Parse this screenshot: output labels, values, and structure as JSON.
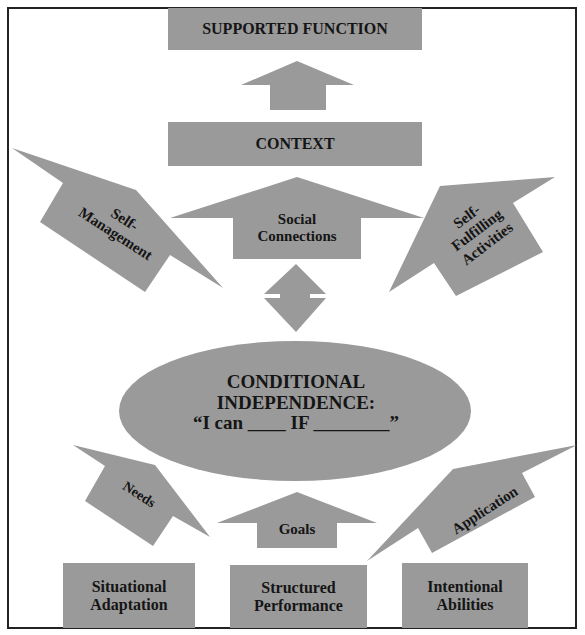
{
  "diagram": {
    "colors": {
      "shape_fill": "#9a9a9a",
      "text": "#151515",
      "border": "#222222",
      "background": "#ffffff"
    },
    "boxes": {
      "supported_function": "SUPPORTED FUNCTION",
      "context": "CONTEXT",
      "situational_adaptation": {
        "line1": "Situational",
        "line2": "Adaptation"
      },
      "structured_performance": {
        "line1": "Structured",
        "line2": "Performance"
      },
      "intentional_abilities": {
        "line1": "Intentional",
        "line2": "Abilities"
      }
    },
    "arrows": {
      "self_management": {
        "line1": "Self-",
        "line2": "Management"
      },
      "social_connections": {
        "line1": "Social",
        "line2": "Connections"
      },
      "self_fulfilling": {
        "line1": "Self-",
        "line2": "Fulfilling",
        "line3": "Activities"
      },
      "needs": "Needs",
      "goals": "Goals",
      "application": "Application"
    },
    "center": {
      "line1": "CONDITIONAL",
      "line2": "INDEPENDENCE:",
      "line3": "“I can ____ IF ________”"
    }
  }
}
